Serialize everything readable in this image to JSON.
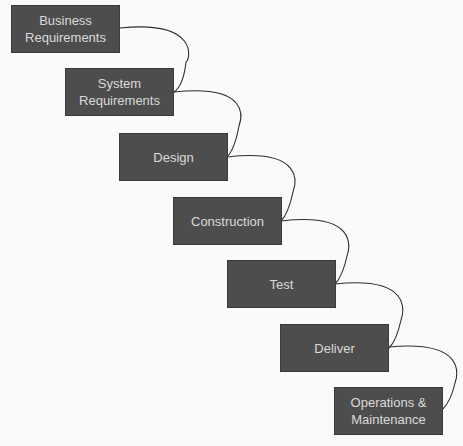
{
  "diagram": {
    "type": "waterfall",
    "colors": {
      "background": "#fafafa",
      "box_fill": "#4d4d4d",
      "box_text": "#dadada",
      "connector": "#2e2e2e"
    },
    "stages": [
      {
        "id": "business-requirements",
        "label": "Business\nRequirements",
        "line1": "Business",
        "line2": "Requirements"
      },
      {
        "id": "system-requirements",
        "label": "System\nRequirements",
        "line1": "System",
        "line2": "Requirements"
      },
      {
        "id": "design",
        "label": "Design",
        "line1": "Design",
        "line2": ""
      },
      {
        "id": "construction",
        "label": "Construction",
        "line1": "Construction",
        "line2": ""
      },
      {
        "id": "test",
        "label": "Test",
        "line1": "Test",
        "line2": ""
      },
      {
        "id": "deliver",
        "label": "Deliver",
        "line1": "Deliver",
        "line2": ""
      },
      {
        "id": "operations-maintenance",
        "label": "Operations &\nMaintenance",
        "line1": "Operations &",
        "line2": "Maintenance"
      }
    ],
    "edges": [
      {
        "from": "business-requirements",
        "to": "system-requirements"
      },
      {
        "from": "system-requirements",
        "to": "design"
      },
      {
        "from": "design",
        "to": "construction"
      },
      {
        "from": "construction",
        "to": "test"
      },
      {
        "from": "test",
        "to": "deliver"
      },
      {
        "from": "deliver",
        "to": "operations-maintenance"
      }
    ]
  }
}
